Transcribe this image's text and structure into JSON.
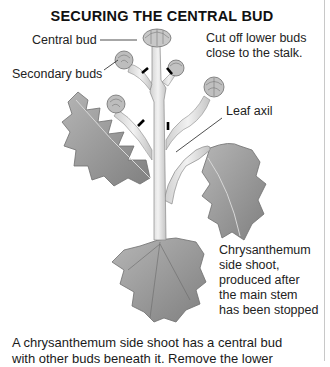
{
  "figure": {
    "title": "SECURING THE CENTRAL BUD",
    "labels": {
      "central_bud": "Central bud",
      "secondary_buds": "Secondary buds",
      "instruction_line1": "Cut off lower buds",
      "instruction_line2": "close to the stalk.",
      "leaf_axil": "Leaf axil",
      "side_shoot_line1": "Chrysanthemum",
      "side_shoot_line2": "side shoot,",
      "side_shoot_line3": "produced after",
      "side_shoot_line4": "the main stem",
      "side_shoot_line5": "has been stopped"
    }
  },
  "body_text": {
    "line1": "A chrysanthemum side shoot has a central bud",
    "line2": "with other buds beneath it. Remove the lower"
  },
  "colors": {
    "text": "#1a1a1a",
    "leaf": "#9a9a9a",
    "stem": "#e4e4e4",
    "cut_mark": "#000000",
    "border": "#c8c8c8"
  }
}
